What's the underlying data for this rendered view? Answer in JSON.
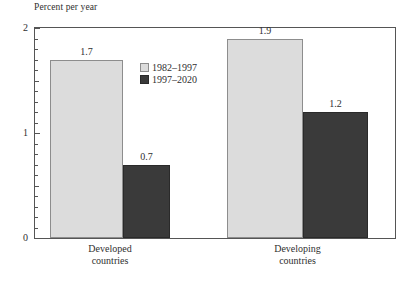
{
  "chart_data": {
    "type": "bar",
    "title": "",
    "ylabel": "Percent per year",
    "xlabel": "",
    "categories": [
      "Developed countries",
      "Developing countries"
    ],
    "category_lines": [
      [
        "Developed",
        "countries"
      ],
      [
        "Developing",
        "countries"
      ]
    ],
    "series": [
      {
        "name": "1982–1997",
        "values": [
          1.7,
          1.9
        ],
        "color": "#dcdcdc"
      },
      {
        "name": "1997–2020",
        "values": [
          0.7,
          1.2
        ],
        "color": "#3a3a3a"
      }
    ],
    "value_labels": [
      "1.7",
      "0.7",
      "1.9",
      "1.2"
    ],
    "ylim": [
      0,
      2
    ],
    "yticks": [
      0,
      1,
      2
    ],
    "ytick_labels": [
      "0",
      "1",
      "2"
    ],
    "minor_tick_step": 0.1,
    "grid": false,
    "legend_position": "inside-top-center"
  },
  "axis": {
    "y_title": "Percent per year",
    "y_labels": [
      {
        "text": "2",
        "value": 2
      },
      {
        "text": "1",
        "value": 1
      },
      {
        "text": "0",
        "value": 0
      }
    ]
  },
  "legend": {
    "items": [
      {
        "label": "1982–1997",
        "swatch": "light"
      },
      {
        "label": "1997–2020",
        "swatch": "dark"
      }
    ]
  },
  "categories": [
    {
      "line1": "Developed",
      "line2": "countries"
    },
    {
      "line1": "Developing",
      "line2": "countries"
    }
  ],
  "bars": [
    {
      "value": 1.7,
      "label": "1.7",
      "series": "1982–1997",
      "group": "Developed countries",
      "tone": "light"
    },
    {
      "value": 0.7,
      "label": "0.7",
      "series": "1997–2020",
      "group": "Developed countries",
      "tone": "dark"
    },
    {
      "value": 1.9,
      "label": "1.9",
      "series": "1982–1997",
      "group": "Developing countries",
      "tone": "light"
    },
    {
      "value": 1.2,
      "label": "1.2",
      "series": "1997–2020",
      "group": "Developing countries",
      "tone": "dark"
    }
  ],
  "colors": {
    "light_fill": "#dcdcdc",
    "light_border": "#8d8d8d",
    "dark_fill": "#3a3a3a",
    "dark_border": "#2a2a2a",
    "axis": "#555555",
    "text": "#2f2f2f",
    "background": "#ffffff"
  }
}
